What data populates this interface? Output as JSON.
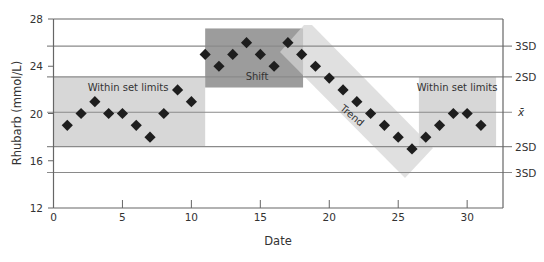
{
  "chart_data": {
    "type": "scatter",
    "title": "",
    "xlabel": "Date",
    "ylabel": "Rhubarb  (mmol/L)",
    "xlim": [
      0,
      32.6
    ],
    "ylim": [
      12,
      28
    ],
    "x_ticks": [
      0,
      5,
      10,
      15,
      20,
      25,
      30
    ],
    "y_ticks": [
      12,
      16,
      20,
      24,
      28
    ],
    "grid": false,
    "legend": null,
    "series": [
      {
        "name": "Rhubarb",
        "marker": "diamond",
        "x": [
          1,
          2,
          3,
          4,
          5,
          6,
          7,
          8,
          9,
          10,
          11,
          12,
          13,
          14,
          15,
          16,
          17,
          18,
          19,
          20,
          21,
          22,
          23,
          24,
          25,
          26,
          27,
          28,
          29,
          30,
          31
        ],
        "y": [
          19,
          20,
          21,
          20,
          20,
          19,
          18,
          20,
          22,
          21,
          25,
          24,
          25,
          26,
          25,
          24,
          26,
          25,
          24,
          23,
          22,
          21,
          20,
          19,
          18,
          17,
          18,
          19,
          20,
          20,
          19
        ]
      }
    ],
    "reference_lines": [
      {
        "label": "3SD",
        "y": 25.7
      },
      {
        "label": "2SD",
        "y": 23.1
      },
      {
        "label": "x̄",
        "y": 20.1
      },
      {
        "label": "2SD",
        "y": 17.2
      },
      {
        "label": "3SD",
        "y": 15.0
      }
    ],
    "annotations": [
      {
        "label": "Within set limits",
        "type": "region",
        "x0": 0,
        "x1": 11.0,
        "y0": 17.2,
        "y1": 23.1
      },
      {
        "label": "Shift",
        "type": "region",
        "x0": 11.0,
        "x1": 18.1,
        "y0": 22.2,
        "y1": 27.2
      },
      {
        "label": "Trend",
        "type": "band",
        "from": [
          18.5,
          27.3
        ],
        "to": [
          25.5,
          14.5
        ]
      },
      {
        "label": "Within set limits",
        "type": "region",
        "x0": 26.5,
        "x1": 32.1,
        "y0": 17.2,
        "y1": 23.1
      }
    ]
  },
  "colors": {
    "axis": "#666666",
    "ref_line": "#8a8a8a",
    "region_light": "#d7d7d7",
    "region_dark": "#9c9c9c",
    "trend_band": "#d4d4d4",
    "marker": "#1e1e1e",
    "text": "#333333"
  }
}
